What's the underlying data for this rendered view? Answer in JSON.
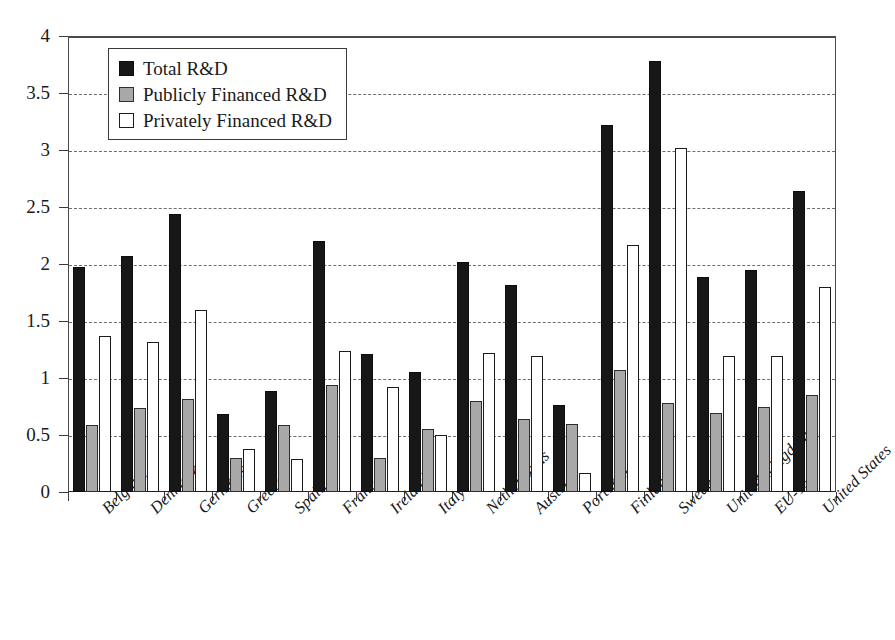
{
  "chart_data": {
    "type": "bar",
    "title": "",
    "xlabel": "",
    "ylabel": "",
    "ylim": [
      0,
      4
    ],
    "ytick_values": [
      0,
      0.5,
      1,
      1.5,
      2,
      2.5,
      3,
      3.5,
      4
    ],
    "ytick_labels": [
      "0",
      "0.5",
      "1",
      "1.5",
      "2",
      "2.5",
      "3",
      "3.5",
      "4"
    ],
    "grid": true,
    "legend_position": "top-left",
    "categories": [
      "Belgium",
      "Denmark",
      "Germany",
      "Greece",
      "Spain",
      "France",
      "Ireland",
      "Italy",
      "Netherlands",
      "Austria",
      "Portugal",
      "Finland",
      "Sweden",
      "United Kingdom",
      "EU-15",
      "United States"
    ],
    "series": [
      {
        "name": "Total R&D",
        "color": "#171717",
        "values": [
          1.97,
          2.07,
          2.44,
          0.68,
          0.89,
          2.2,
          1.21,
          1.05,
          2.02,
          1.82,
          0.76,
          3.22,
          3.78,
          1.89,
          1.95,
          2.64
        ]
      },
      {
        "name": "Publicly Financed R&D",
        "color": "#a8a8a8",
        "values": [
          0.59,
          0.74,
          0.82,
          0.3,
          0.59,
          0.94,
          0.3,
          0.55,
          0.8,
          0.64,
          0.6,
          1.07,
          0.78,
          0.69,
          0.75,
          0.85
        ]
      },
      {
        "name": "Privately Financed R&D",
        "color": "#ffffff",
        "values": [
          1.37,
          1.32,
          1.6,
          0.38,
          0.29,
          1.24,
          0.92,
          0.5,
          1.22,
          1.19,
          0.17,
          2.17,
          3.02,
          1.19,
          1.19,
          1.8
        ]
      }
    ]
  },
  "legend": {
    "items": [
      {
        "label": "Total R&D",
        "swatch": "total"
      },
      {
        "label": "Publicly Financed R&D",
        "swatch": "public"
      },
      {
        "label": "Privately Financed R&D",
        "swatch": "private"
      }
    ]
  }
}
